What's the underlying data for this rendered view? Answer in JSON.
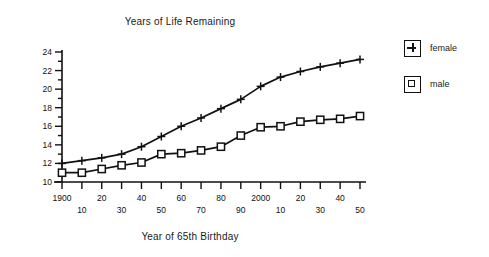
{
  "chart_data": {
    "type": "line",
    "title": "Years of Life Remaining",
    "xlabel": "Year of 65th Birthday",
    "ylabel": "",
    "x": [
      1900,
      1910,
      1920,
      1930,
      1940,
      1950,
      1960,
      1970,
      1980,
      1990,
      2000,
      2010,
      2020,
      2030,
      2040,
      2050
    ],
    "xtick_labels": [
      "1900",
      "10",
      "20",
      "30",
      "40",
      "50",
      "60",
      "70",
      "80",
      "90",
      "2000",
      "10",
      "20",
      "30",
      "40",
      "50"
    ],
    "ytick_labels": [
      "10",
      "12",
      "14",
      "16",
      "18",
      "20",
      "22",
      "24"
    ],
    "ytick_values": [
      10,
      12,
      14,
      16,
      18,
      20,
      22,
      24
    ],
    "ylim": [
      9.3,
      24.6
    ],
    "xlim": [
      1898,
      2053
    ],
    "grid": false,
    "legend_position": "right",
    "series": [
      {
        "name": "female",
        "marker": "plus",
        "values": [
          12.0,
          12.3,
          12.6,
          13.0,
          13.8,
          14.9,
          16.0,
          16.9,
          17.9,
          18.9,
          20.3,
          21.3,
          21.9,
          22.4,
          22.8,
          23.2
        ]
      },
      {
        "name": "male",
        "marker": "square",
        "values": [
          11.0,
          11.0,
          11.4,
          11.8,
          12.1,
          13.0,
          13.1,
          13.4,
          13.8,
          15.0,
          15.9,
          16.0,
          16.5,
          16.7,
          16.8,
          17.1
        ]
      }
    ]
  },
  "legend": {
    "items": [
      {
        "label": "female",
        "marker": "plus"
      },
      {
        "label": "male",
        "marker": "square"
      }
    ]
  }
}
